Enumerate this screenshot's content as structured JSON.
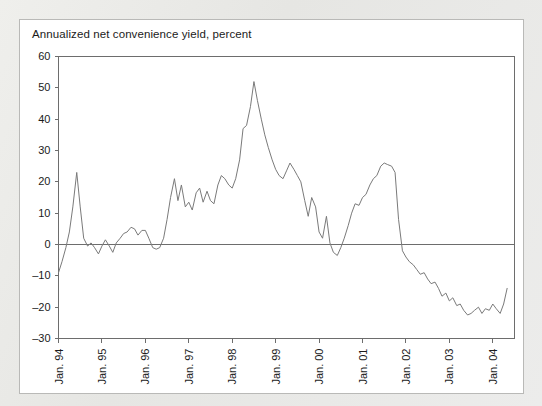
{
  "figure": {
    "background_color": "#e9e9e7",
    "panel_color": "#ffffff",
    "panel_border_color": "#b9b9b7",
    "line_color": "#7a7a7a",
    "axis_color": "#6d6d6d",
    "text_color": "#1b1b1b"
  },
  "chart_data": {
    "type": "line",
    "title": "Annualized net convenience yield, percent",
    "xlabel": "",
    "ylabel": "",
    "ylim": [
      -30,
      60
    ],
    "yticks": [
      -30,
      -20,
      -10,
      0,
      10,
      20,
      30,
      40,
      50,
      60
    ],
    "ytick_labels": [
      "–30",
      "–20",
      "–10",
      "0",
      "10",
      "20",
      "30",
      "40",
      "50",
      "60"
    ],
    "xlim": [
      1994.0,
      2004.5
    ],
    "xticks": [
      1994,
      1995,
      1996,
      1997,
      1998,
      1999,
      2000,
      2001,
      2002,
      2003,
      2004
    ],
    "xtick_labels": [
      "Jan. 94",
      "Jan. 95",
      "Jan. 96",
      "Jan. 97",
      "Jan. 98",
      "Jan. 99",
      "Jan. 00",
      "Jan. 01",
      "Jan. 02",
      "Jan. 03",
      "Jan. 04"
    ],
    "xtick_rotation": -90,
    "grid": false,
    "legend": false,
    "zero_reference_line": 0,
    "series": [
      {
        "name": "Annualized net convenience yield",
        "color": "#7a7a7a",
        "x": [
          1994.0,
          1994.08,
          1994.17,
          1994.25,
          1994.33,
          1994.42,
          1994.5,
          1994.58,
          1994.67,
          1994.75,
          1994.83,
          1994.92,
          1995.0,
          1995.08,
          1995.17,
          1995.25,
          1995.33,
          1995.42,
          1995.5,
          1995.58,
          1995.67,
          1995.75,
          1995.83,
          1995.92,
          1996.0,
          1996.08,
          1996.17,
          1996.25,
          1996.33,
          1996.42,
          1996.5,
          1996.58,
          1996.67,
          1996.75,
          1996.83,
          1996.92,
          1997.0,
          1997.08,
          1997.17,
          1997.25,
          1997.33,
          1997.42,
          1997.5,
          1997.58,
          1997.67,
          1997.75,
          1997.83,
          1997.92,
          1998.0,
          1998.08,
          1998.17,
          1998.25,
          1998.33,
          1998.42,
          1998.5,
          1998.58,
          1998.67,
          1998.75,
          1998.83,
          1998.92,
          1999.0,
          1999.08,
          1999.17,
          1999.25,
          1999.33,
          1999.42,
          1999.5,
          1999.58,
          1999.67,
          1999.75,
          1999.83,
          1999.92,
          2000.0,
          2000.08,
          2000.17,
          2000.25,
          2000.33,
          2000.42,
          2000.5,
          2000.58,
          2000.67,
          2000.75,
          2000.83,
          2000.92,
          2001.0,
          2001.08,
          2001.17,
          2001.25,
          2001.33,
          2001.42,
          2001.5,
          2001.58,
          2001.67,
          2001.75,
          2001.83,
          2001.92,
          2002.0,
          2002.08,
          2002.17,
          2002.25,
          2002.33,
          2002.42,
          2002.5,
          2002.58,
          2002.67,
          2002.75,
          2002.83,
          2002.92,
          2003.0,
          2003.08,
          2003.17,
          2003.25,
          2003.33,
          2003.42,
          2003.5,
          2003.58,
          2003.67,
          2003.75,
          2003.83,
          2003.92,
          2004.0,
          2004.08,
          2004.17,
          2004.25,
          2004.33
        ],
        "values": [
          -9.0,
          -5.5,
          -1.0,
          4.0,
          12.0,
          23.0,
          12.0,
          2.0,
          -0.5,
          0.5,
          -1.0,
          -3.0,
          -0.5,
          1.5,
          -0.5,
          -2.5,
          0.5,
          2.0,
          3.5,
          4.0,
          5.5,
          5.0,
          3.0,
          4.5,
          4.5,
          2.0,
          -1.0,
          -1.5,
          -1.0,
          2.0,
          8.0,
          15.0,
          21.0,
          14.0,
          19.0,
          12.0,
          13.5,
          11.0,
          16.5,
          18.0,
          13.5,
          17.0,
          14.0,
          13.0,
          19.0,
          22.0,
          21.0,
          19.0,
          18.0,
          21.0,
          27.0,
          37.0,
          38.0,
          44.0,
          52.0,
          46.0,
          40.0,
          35.0,
          31.0,
          27.0,
          24.0,
          22.0,
          21.0,
          23.5,
          26.0,
          24.0,
          22.0,
          20.0,
          14.0,
          9.0,
          15.0,
          12.0,
          4.0,
          2.0,
          9.0,
          0.5,
          -2.5,
          -3.5,
          -1.0,
          2.0,
          6.0,
          10.0,
          13.0,
          12.5,
          15.0,
          16.0,
          19.0,
          21.0,
          22.0,
          25.0,
          26.0,
          25.5,
          25.0,
          23.0,
          8.0,
          -2.0,
          -4.0,
          -5.5,
          -6.5,
          -8.0,
          -9.5,
          -9.0,
          -11.0,
          -12.5,
          -12.0,
          -14.0,
          -16.5,
          -15.5,
          -18.0,
          -17.0,
          -19.5,
          -19.0,
          -21.0,
          -22.5,
          -22.0,
          -21.0,
          -20.0,
          -22.0,
          -20.5,
          -21.0,
          -19.0,
          -20.5,
          -22.0,
          -19.0,
          -14.0
        ]
      }
    ]
  }
}
